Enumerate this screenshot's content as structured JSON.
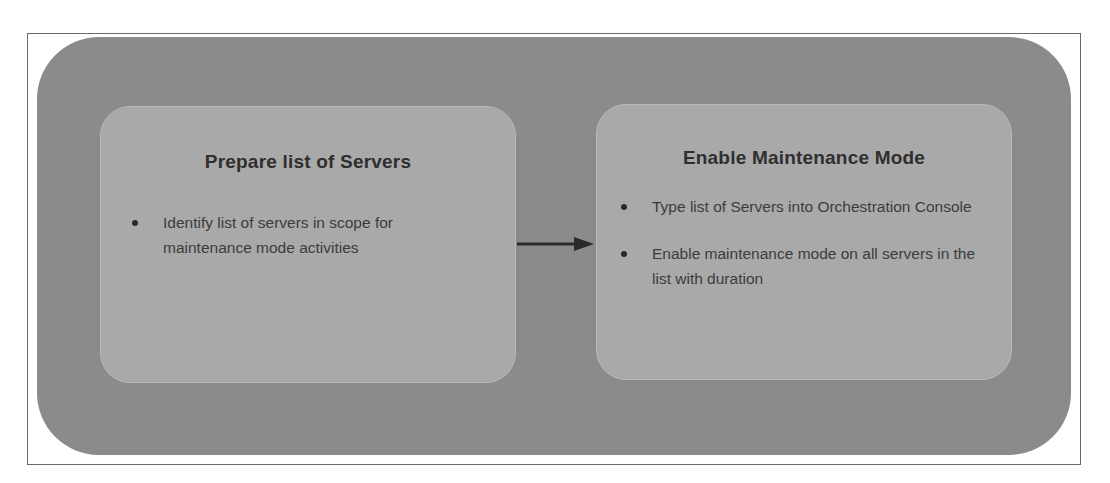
{
  "diagram": {
    "type": "process-flow",
    "colors": {
      "outer_shape": "#8b8b8b",
      "step_box": "#a9a9a9",
      "text": "#2f2f2f",
      "arrow": "#2a2a2a"
    },
    "steps": [
      {
        "title": "Prepare list of Servers",
        "bullets": [
          "Identify list of servers in scope for maintenance mode activities"
        ]
      },
      {
        "title": "Enable Maintenance Mode",
        "bullets": [
          "Type list of Servers into Orchestration Console",
          "Enable maintenance mode on all servers in the list with duration"
        ]
      }
    ],
    "connector": {
      "from": "Prepare list of Servers",
      "to": "Enable Maintenance Mode",
      "icon": "arrow-right-icon"
    }
  }
}
